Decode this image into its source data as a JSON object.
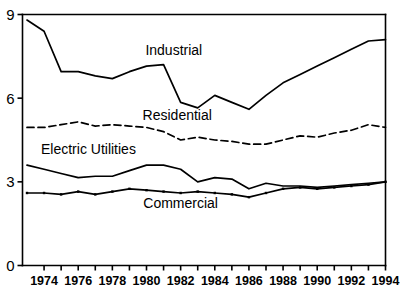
{
  "chart_data": {
    "type": "line",
    "title": "",
    "subtitle": "",
    "xlabel": "",
    "ylabel": "",
    "xlim": [
      1973,
      1994
    ],
    "ylim": [
      0,
      9
    ],
    "grid": false,
    "legend_position": "inline-annotations",
    "x": [
      1973,
      1974,
      1975,
      1976,
      1977,
      1978,
      1979,
      1980,
      1981,
      1982,
      1983,
      1984,
      1985,
      1986,
      1987,
      1988,
      1989,
      1990,
      1991,
      1992,
      1993,
      1994
    ],
    "x_tick_labels": [
      "1974",
      "1976",
      "1978",
      "1980",
      "1982",
      "1984",
      "1986",
      "1988",
      "1990",
      "1992",
      "1994"
    ],
    "x_tick_values": [
      1974,
      1976,
      1978,
      1980,
      1982,
      1984,
      1986,
      1988,
      1990,
      1992,
      1994
    ],
    "y_tick_labels": [
      "0",
      "3",
      "6",
      "9"
    ],
    "y_tick_values": [
      0,
      3,
      6,
      9
    ],
    "series": [
      {
        "name": "Industrial",
        "style": "solid",
        "markers": false,
        "label_x": 1981.6,
        "label_y": 7.55,
        "values": [
          8.8,
          8.4,
          6.95,
          6.95,
          6.8,
          6.7,
          6.95,
          7.15,
          7.2,
          5.85,
          5.65,
          6.1,
          5.85,
          5.6,
          6.1,
          6.55,
          6.85,
          7.15,
          7.45,
          7.75,
          8.05,
          8.1
        ]
      },
      {
        "name": "Residential",
        "style": "dashed",
        "markers": false,
        "label_x": 1981.8,
        "label_y": 5.2,
        "values": [
          4.95,
          4.95,
          5.05,
          5.15,
          5.0,
          5.05,
          5.0,
          4.95,
          4.8,
          4.5,
          4.6,
          4.5,
          4.45,
          4.35,
          4.35,
          4.5,
          4.65,
          4.6,
          4.75,
          4.85,
          5.05,
          4.95
        ]
      },
      {
        "name": "Electric Utilities",
        "style": "solid",
        "markers": false,
        "label_x": 1976.6,
        "label_y": 4.0,
        "values": [
          3.6,
          3.45,
          3.3,
          3.15,
          3.2,
          3.2,
          3.4,
          3.6,
          3.6,
          3.45,
          3.0,
          3.15,
          3.1,
          2.75,
          2.95,
          2.85,
          2.85,
          2.8,
          2.85,
          2.9,
          2.95,
          3.0
        ]
      },
      {
        "name": "Commercial",
        "style": "solid",
        "markers": true,
        "label_x": 1982.0,
        "label_y": 2.05,
        "values": [
          2.6,
          2.6,
          2.55,
          2.65,
          2.55,
          2.65,
          2.75,
          2.7,
          2.65,
          2.6,
          2.65,
          2.6,
          2.55,
          2.45,
          2.6,
          2.75,
          2.8,
          2.75,
          2.8,
          2.85,
          2.9,
          3.0
        ]
      }
    ]
  },
  "axes": {
    "y_axis_name": "value-axis",
    "x_axis_name": "year-axis"
  }
}
